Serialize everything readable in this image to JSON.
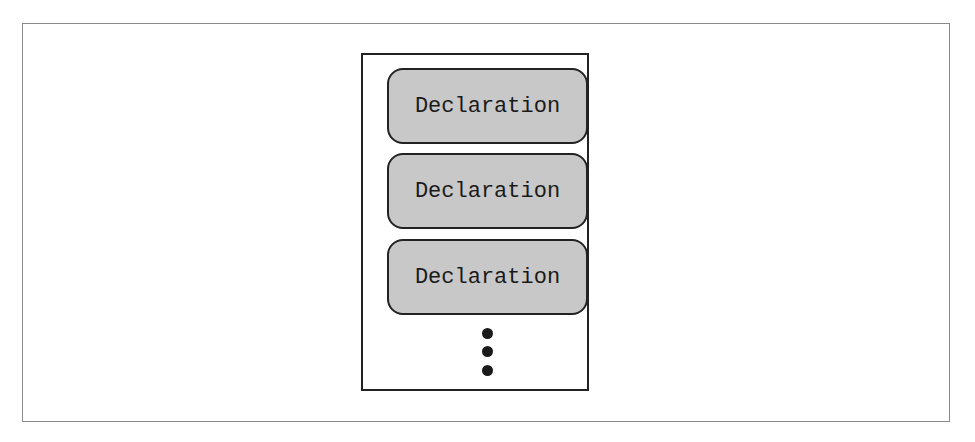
{
  "diagram": {
    "declarations": [
      {
        "label": "Declaration"
      },
      {
        "label": "Declaration"
      },
      {
        "label": "Declaration"
      }
    ],
    "continuation": "⋮",
    "colors": {
      "box_fill": "#c8c8c8",
      "border": "#222222",
      "frame": "#8a8a8a"
    }
  }
}
